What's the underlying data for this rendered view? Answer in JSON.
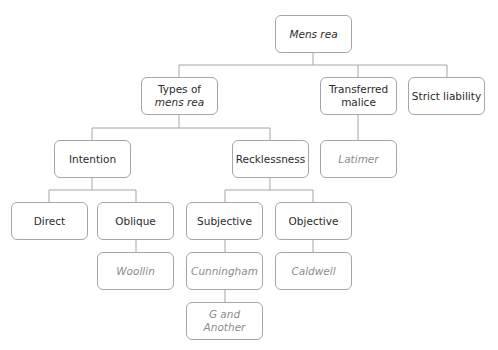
{
  "diagram": {
    "title": "Mens rea",
    "colors": {
      "border": "#a6a6a6",
      "line": "#a6a6a6",
      "concept_text": "#2b2b2b",
      "case_text": "#8c8c8c"
    },
    "nodes": {
      "root": {
        "label": "Mens rea",
        "style": "italic"
      },
      "types": {
        "line1": "Types of",
        "line2": "mens rea"
      },
      "transferred": {
        "line1": "Transferred",
        "line2": "malice"
      },
      "strict": {
        "label": "Strict liability"
      },
      "intention": {
        "label": "Intention"
      },
      "recklessness": {
        "label": "Recklessness"
      },
      "latimer": {
        "label": "Latimer",
        "type": "case"
      },
      "direct": {
        "label": "Direct"
      },
      "oblique": {
        "label": "Oblique"
      },
      "subjective": {
        "label": "Subjective"
      },
      "objective": {
        "label": "Objective"
      },
      "woollin": {
        "label": "Woollin",
        "type": "case"
      },
      "cunningham": {
        "label": "Cunningham",
        "type": "case"
      },
      "caldwell": {
        "label": "Caldwell",
        "type": "case"
      },
      "g_and_another": {
        "label": "G and Another",
        "type": "case"
      }
    },
    "edges": [
      [
        "root",
        "types"
      ],
      [
        "root",
        "transferred"
      ],
      [
        "root",
        "strict"
      ],
      [
        "types",
        "intention"
      ],
      [
        "types",
        "recklessness"
      ],
      [
        "transferred",
        "latimer"
      ],
      [
        "intention",
        "direct"
      ],
      [
        "intention",
        "oblique"
      ],
      [
        "recklessness",
        "subjective"
      ],
      [
        "recklessness",
        "objective"
      ],
      [
        "oblique",
        "woollin"
      ],
      [
        "subjective",
        "cunningham"
      ],
      [
        "cunningham",
        "g_and_another"
      ],
      [
        "objective",
        "caldwell"
      ]
    ]
  }
}
